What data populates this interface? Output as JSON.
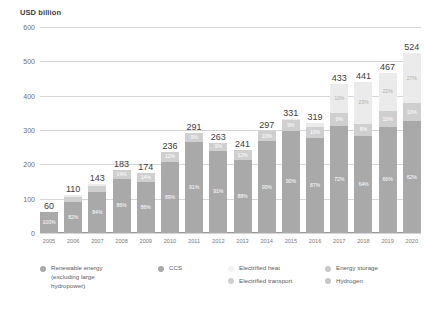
{
  "chart_data": {
    "type": "bar",
    "title": "",
    "subtitle": "",
    "ylabel": "USD billion",
    "xlabel": "",
    "ylim": [
      0,
      600
    ],
    "grid": true,
    "stacked": true,
    "legend_position": "bottom",
    "yticks": [
      "600",
      "500",
      "400",
      "300",
      "200",
      "100",
      "0"
    ],
    "categories": [
      "2005",
      "2006",
      "2007",
      "2008",
      "2009",
      "2010",
      "2011",
      "2012",
      "2013",
      "2014",
      "2015",
      "2016",
      "2017",
      "2018",
      "2019",
      "2020"
    ],
    "totals": [
      60,
      110,
      143,
      183,
      174,
      236,
      291,
      263,
      241,
      297,
      331,
      319,
      433,
      441,
      467,
      524
    ],
    "total_labels": [
      "60",
      "110",
      "143",
      "183",
      "174",
      "236",
      "291",
      "263",
      "241",
      "297",
      "331",
      "319",
      "433",
      "441",
      "467",
      "524"
    ],
    "series": [
      {
        "name": "Renewable energy (excluding large hydropower)",
        "color": "#a9a9a9",
        "values_pct": [
          100,
          82,
          84,
          86,
          86,
          89,
          91,
          91,
          88,
          90,
          90,
          87,
          72,
          64,
          66,
          62
        ],
        "labels": [
          "100%",
          "82%",
          "84%",
          "86%",
          "86%",
          "89%",
          "91%",
          "91%",
          "88%",
          "90%",
          "90%",
          "87%",
          "72%",
          "64%",
          "66%",
          "62%"
        ]
      },
      {
        "name": "Electrified transport",
        "color": "#cfcfcf",
        "values_pct": [
          0,
          14,
          12,
          14,
          14,
          12,
          9,
          9,
          12,
          10,
          9,
          10,
          9,
          8,
          10,
          10
        ],
        "labels": [
          "",
          "14%",
          "12%",
          "14%",
          "14%",
          "12%",
          "9%",
          "9%",
          "12%",
          "10%",
          "9%",
          "10%",
          "9%",
          "8%",
          "10%",
          "10%"
        ]
      },
      {
        "name": "Electrified heat",
        "color": "#ebebeb",
        "values_pct": [
          0,
          4,
          4,
          0,
          0,
          0,
          0,
          0,
          0,
          0,
          1,
          3,
          19,
          28,
          24,
          28
        ],
        "labels": [
          "",
          "",
          "",
          "",
          "",
          "",
          "",
          "",
          "",
          "",
          "",
          "",
          "10%",
          "23%",
          "22%",
          "27%"
        ]
      }
    ],
    "legend": [
      {
        "label": "Renewable energy\n(excluding large\nhydropower)",
        "color": "#a9a9a9"
      },
      {
        "label": "CCS",
        "color": "#a9a9a9"
      },
      {
        "label": "Electrified heat",
        "color": "#f2f2f2"
      },
      {
        "label": "Energy storage",
        "color": "#c9c9c9"
      },
      {
        "label": "Electrified transport",
        "color": "#cfcfcf"
      },
      {
        "label": "Hydrogen",
        "color": "#c9c9c9"
      }
    ],
    "colors": {
      "renewable": "#a9a9a9",
      "electrified_transport": "#cfcfcf",
      "electrified_heat": "#ebebeb",
      "gridline": "#d6d6d6",
      "axis": "#9a9a9a",
      "text": "#5c5c5c"
    }
  }
}
